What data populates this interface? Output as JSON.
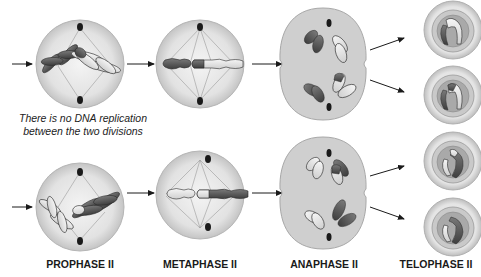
{
  "note": {
    "line1": "There is no DNA replication",
    "line2": "between the two divisions"
  },
  "stages": [
    {
      "id": "prophase",
      "label": "PROPHASE II"
    },
    {
      "id": "metaphase",
      "label": "METAPHASE II"
    },
    {
      "id": "anaphase",
      "label": "ANAPHASE II"
    },
    {
      "id": "telophase",
      "label": "TELOPHASE II"
    }
  ],
  "colors": {
    "cell_fill": "#e6e6e6",
    "cell_edge": "#b5b5b5",
    "anaphase_fill": "#cfcfcf",
    "dark_chromosome": "#5a5a5a",
    "light_chromosome": "#e8e8e8",
    "outline": "#2a2a2a",
    "spindle": "#9a9a9a",
    "centrosome": "#1a1a1a",
    "arrow": "#1a1a1a"
  }
}
